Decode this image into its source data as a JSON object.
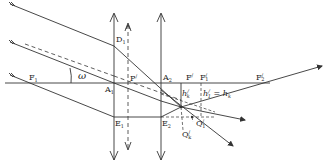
{
  "diagram": {
    "type": "optics-ray-diagram",
    "colors": {
      "line": "#333333",
      "background": "#ffffff"
    },
    "labels": {
      "F1": "F",
      "F1_sub": "1",
      "omega": "ω",
      "D1": "D",
      "D1_sub": "1",
      "P_prime": "P",
      "P_prime_sup": "/",
      "A1": "A",
      "A1_sub": "1",
      "A2": "A",
      "A2_sub": "2",
      "E1": "E",
      "E1_sub": "1",
      "E2": "E",
      "E2_sub": "2",
      "F_prime": "F",
      "F_prime_sup": "/",
      "F1_prime": "F",
      "F1_prime_sub": "1",
      "F1_prime_sup": "/",
      "F2_prime": "F",
      "F2_prime_sub": "2",
      "F2_prime_sup": "/",
      "h_k_prime": "h",
      "h_k_prime_sub": "k",
      "h_k_prime_sup": "/",
      "h1_eq_hk": "h",
      "h1_eq_hk_sub1": "1",
      "h1_eq_hk_sup": "/",
      "h1_eq_hk_mid": " = h",
      "h1_eq_hk_sub2": "k",
      "Q1_prime": "Q",
      "Q1_prime_sub": "1",
      "Q1_prime_sup": "/",
      "Qk_prime": "Q",
      "Qk_prime_sub": "k",
      "Qk_prime_sup": "/"
    },
    "elements": {
      "optical_axis": {
        "x1": 5,
        "y": 83,
        "x2": 270
      },
      "lens_1": {
        "x": 114,
        "y_top": 13,
        "y_bottom": 160
      },
      "aperture_stop": {
        "x": 128,
        "y_top": 23,
        "y_bottom": 150
      },
      "lens_2": {
        "x": 161,
        "y_top": 13,
        "y_bottom": 160
      }
    }
  }
}
